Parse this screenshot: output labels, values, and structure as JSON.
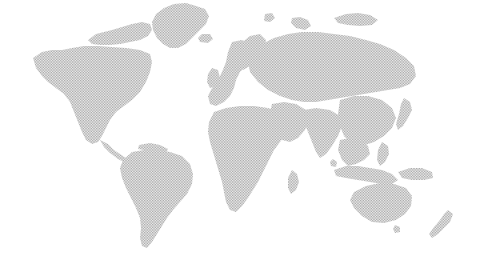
{
  "figure": {
    "name": "world-map",
    "type": "halftone-dotted-world-map",
    "width": 478,
    "height": 269,
    "background_color": "#ffffff",
    "land_color": "#9b9b9b",
    "land_fill_style": "halftone-dot-screen",
    "dot_spacing_px": 1.6,
    "projection": "equirectangular",
    "has_borders": false,
    "has_labels": false,
    "has_graticule": false,
    "has_legend": false,
    "has_axes": false
  },
  "landmasses": [
    {
      "id": "greenland",
      "label": "Greenland",
      "bbox": [
        148,
        2,
        212,
        52
      ],
      "path": "M196 6 L205 9 L209 16 L206 24 L199 31 L192 38 L186 44 L178 48 L170 48 L163 44 L157 38 L153 30 L152 22 L156 14 L164 8 L174 4 L186 3 Z"
    },
    {
      "id": "arctic-canada",
      "label": "Arctic Canada Archipelago",
      "bbox": [
        72,
        12,
        160,
        56
      ],
      "path": "M88 40 L96 34 L104 32 L112 30 L122 27 L132 24 L142 22 L150 24 L152 30 L148 36 L140 40 L130 42 L120 44 L110 45 L100 45 L92 44 Z"
    },
    {
      "id": "north-america",
      "label": "North America",
      "bbox": [
        30,
        38,
        160,
        150
      ],
      "path": "M33 58 L42 52 L52 50 L62 50 L72 48 L84 46 L98 46 L112 47 L126 48 L140 50 L150 54 L152 62 L150 72 L146 82 L140 92 L132 100 L124 106 L116 112 L110 120 L106 128 L102 136 L98 142 L92 144 L86 140 L82 132 L78 122 L74 112 L70 102 L64 94 L56 88 L48 82 L42 76 L36 68 Z"
    },
    {
      "id": "central-america",
      "label": "Central America & Caribbean",
      "bbox": [
        98,
        138,
        142,
        166
      ],
      "path": "M100 140 L108 144 L114 150 L120 154 L126 158 L132 160 L138 162 L140 166 L134 166 L126 163 L118 159 L110 153 L104 147 Z"
    },
    {
      "id": "south-america",
      "label": "South America",
      "bbox": [
        118,
        148,
        196,
        250
      ],
      "path": "M132 152 L144 150 L158 150 L170 152 L182 156 L190 164 L193 174 L192 184 L187 194 L180 202 L173 210 L167 218 L162 226 L157 234 L152 242 L147 248 L142 246 L140 238 L141 228 L140 218 L136 208 L131 198 L126 188 L122 178 L120 168 L123 160 Z"
    },
    {
      "id": "europe",
      "label": "Europe",
      "bbox": [
        206,
        36,
        268,
        116
      ],
      "path": "M232 42 L242 40 L250 44 L254 52 L252 60 L246 66 L240 72 L236 80 L234 88 L230 96 L224 102 L216 106 L210 104 L208 96 L212 88 L218 80 L222 72 L226 62 L228 52 Z"
    },
    {
      "id": "africa",
      "label": "Africa",
      "bbox": [
        208,
        104,
        292,
        218
      ],
      "path": "M214 112 L226 108 L240 106 L254 106 L268 108 L280 112 L288 118 L290 126 L286 134 L280 142 L274 150 L270 158 L266 166 L262 174 L258 182 L253 190 L248 198 L242 206 L236 212 L230 210 L226 202 L224 192 L222 182 L219 172 L216 162 L213 152 L210 142 L208 132 L209 122 Z"
    },
    {
      "id": "madagascar",
      "label": "Madagascar",
      "bbox": [
        288,
        168,
        300,
        196
      ],
      "path": "M292 170 L297 174 L299 182 L296 190 L291 194 L288 188 L288 178 Z"
    },
    {
      "id": "middle-east",
      "label": "Middle East & Arabia",
      "bbox": [
        268,
        100,
        310,
        146
      ],
      "path": "M272 104 L284 102 L296 104 L306 110 L309 120 L305 130 L298 138 L290 142 L282 140 L276 132 L272 122 L270 112 Z"
    },
    {
      "id": "russia-north-asia",
      "label": "Russia & Northern Asia",
      "bbox": [
        248,
        28,
        420,
        110
      ],
      "path": "M252 52 L262 44 L274 38 L288 34 L302 32 L318 32 L334 34 L350 36 L366 40 L380 44 L394 50 L406 58 L414 66 L416 76 L410 84 L400 88 L388 90 L376 92 L364 94 L352 96 L340 98 L328 100 L316 102 L304 102 L292 100 L280 96 L268 90 L258 82 L250 72 L248 62 Z"
    },
    {
      "id": "south-asia",
      "label": "South Asia (India)",
      "bbox": [
        300,
        106,
        344,
        160
      ],
      "path": "M304 110 L316 108 L330 110 L340 116 L342 126 L338 136 L332 146 L326 154 L320 158 L316 152 L312 142 L308 132 L304 122 Z"
    },
    {
      "id": "east-asia",
      "label": "East Asia (China & Korea)",
      "bbox": [
        336,
        94,
        400,
        150
      ],
      "path": "M340 100 L354 96 L368 96 L382 100 L392 108 L396 118 L392 128 L384 136 L374 142 L362 146 L352 144 L344 136 L340 126 L338 114 Z"
    },
    {
      "id": "japan",
      "label": "Japan",
      "bbox": [
        396,
        96,
        416,
        132
      ],
      "path": "M404 98 L410 102 L412 110 L408 118 L403 126 L398 130 L396 124 L399 114 L401 104 Z"
    },
    {
      "id": "southeast-asia",
      "label": "Southeast Asia & Indochina",
      "bbox": [
        336,
        136,
        376,
        172
      ],
      "path": "M340 140 L350 138 L360 140 L368 146 L370 154 L364 160 L356 164 L348 166 L342 160 L338 150 Z"
    },
    {
      "id": "indonesia",
      "label": "Indonesian Archipelago",
      "bbox": [
        330,
        160,
        402,
        188
      ],
      "path": "M334 170 L346 166 L358 166 L370 168 L382 170 L392 174 L398 180 L392 184 L382 184 L370 182 L358 180 L346 178 L336 176 Z"
    },
    {
      "id": "philippines",
      "label": "Philippines",
      "bbox": [
        376,
        140,
        392,
        168
      ],
      "path": "M382 142 L388 146 L389 154 L385 162 L380 166 L377 160 L378 150 Z"
    },
    {
      "id": "new-guinea",
      "label": "New Guinea",
      "bbox": [
        396,
        166,
        434,
        184
      ],
      "path": "M398 172 L410 168 L422 168 L432 172 L433 178 L424 180 L412 180 L402 178 Z"
    },
    {
      "id": "australia",
      "label": "Australia",
      "bbox": [
        348,
        180,
        414,
        226
      ],
      "path": "M354 192 L366 186 L380 183 L394 184 L406 188 L412 196 L411 206 L405 214 L396 220 L384 223 L372 222 L362 216 L354 208 L350 200 Z"
    },
    {
      "id": "tasmania",
      "label": "Tasmania",
      "bbox": [
        392,
        224,
        402,
        234
      ],
      "path": "M395 225 L400 227 L400 232 L395 233 L393 229 Z"
    },
    {
      "id": "new-zealand",
      "label": "New Zealand",
      "bbox": [
        428,
        208,
        456,
        240
      ],
      "path": "M448 210 L453 214 L450 222 L444 228 L438 234 L432 238 L429 234 L434 227 L440 220 L444 214 Z"
    },
    {
      "id": "british-isles",
      "label": "British Isles",
      "bbox": [
        206,
        66,
        222,
        90
      ],
      "path": "M212 68 L218 70 L220 78 L216 86 L210 88 L207 82 L208 74 Z"
    },
    {
      "id": "iceland",
      "label": "Iceland",
      "bbox": [
        198,
        32,
        214,
        44
      ],
      "path": "M202 34 L210 34 L213 39 L208 43 L200 42 L198 38 Z"
    },
    {
      "id": "scandinavia",
      "label": "Scandinavia",
      "bbox": [
        236,
        32,
        268,
        72
      ],
      "path": "M240 44 L250 36 L260 34 L266 40 L264 50 L258 58 L250 66 L243 70 L239 64 L238 54 Z"
    },
    {
      "id": "svalbard",
      "label": "Svalbard",
      "bbox": [
        262,
        12,
        276,
        24
      ],
      "path": "M265 14 L272 13 L275 18 L270 22 L264 21 Z"
    },
    {
      "id": "novaya-zemlya",
      "label": "Novaya Zemlya",
      "bbox": [
        290,
        16,
        312,
        34
      ],
      "path": "M292 18 L300 17 L308 20 L311 26 L305 30 L296 28 L291 23 Z"
    },
    {
      "id": "arctic-islands-east",
      "label": "Eastern Arctic Islands",
      "bbox": [
        330,
        10,
        380,
        30
      ],
      "path": "M334 18 L346 14 L358 13 L370 15 L378 20 L372 25 L360 26 L348 25 L338 23 Z"
    },
    {
      "id": "sri-lanka",
      "label": "Sri Lanka",
      "bbox": [
        330,
        158,
        338,
        168
      ],
      "path": "M333 159 L337 162 L336 167 L331 166 L330 162 Z"
    },
    {
      "id": "cuba-caribbean",
      "label": "Cuba & Greater Antilles",
      "bbox": [
        136,
        142,
        170,
        156
      ],
      "path": "M139 145 L150 143 L160 145 L168 149 L166 153 L155 152 L144 150 L138 149 Z"
    },
    {
      "id": "baja-peninsula",
      "label": "Baja California",
      "bbox": [
        88,
        120,
        102,
        144
      ],
      "path": "M91 122 L97 124 L99 132 L95 140 L90 142 L88 136 L89 128 Z"
    }
  ]
}
